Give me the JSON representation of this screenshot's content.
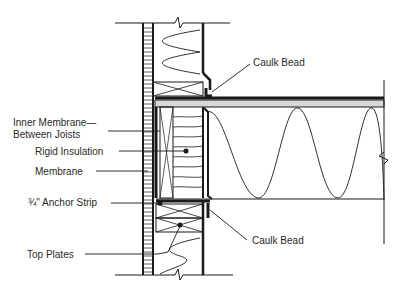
{
  "diagram": {
    "type": "architectural-section",
    "labels": {
      "caulk_bead_top": "Caulk Bead",
      "caulk_bead_bottom": "Caulk Bead",
      "inner_membrane_line1": "Inner Membrane—",
      "inner_membrane_line2": "Between Joists",
      "rigid_insulation": "Rigid Insulation",
      "membrane": "Membrane",
      "anchor_strip": "¾\" Anchor Strip",
      "top_plates": "Top Plates"
    },
    "colors": {
      "ink": "#1a1a1a",
      "text": "#2a2a2a",
      "background": "#ffffff",
      "joist_fill": "#cfcfcf"
    }
  }
}
